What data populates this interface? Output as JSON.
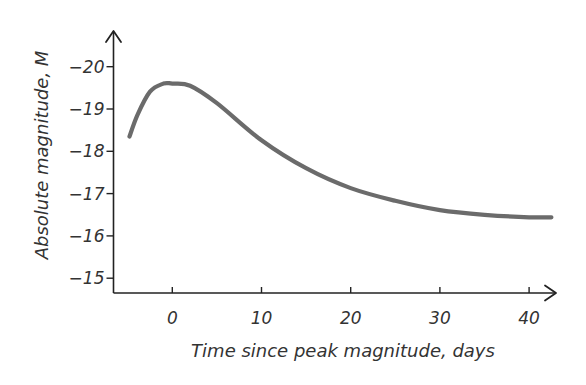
{
  "chart_data": {
    "type": "line",
    "title": "",
    "xlabel": "Time since peak magnitude, days",
    "ylabel": "Absolute magnitude, M",
    "x_ticks": [
      0,
      10,
      20,
      30,
      40
    ],
    "x_tick_labels": [
      "0",
      "10",
      "20",
      "30",
      "40"
    ],
    "y_ticks": [
      -20,
      -19,
      -18,
      -17,
      -16,
      -15
    ],
    "y_tick_labels": [
      "−20",
      "−19",
      "−18",
      "−17",
      "−16",
      "−15"
    ],
    "xlim": [
      -6.5,
      43
    ],
    "ylim": [
      -15.3,
      -20.9
    ],
    "y_inverted": true,
    "grid": false,
    "legend": null,
    "series": [
      {
        "name": "Type Ia supernova light curve",
        "color": "#6b6b6b",
        "x": [
          -4.8,
          -3.9,
          -2.5,
          -1.0,
          0,
          2,
          5,
          10,
          15,
          20,
          25,
          30,
          35,
          40,
          42.5
        ],
        "y": [
          -18.35,
          -18.86,
          -19.41,
          -19.6,
          -19.6,
          -19.55,
          -19.14,
          -18.26,
          -17.6,
          -17.13,
          -16.83,
          -16.61,
          -16.5,
          -16.44,
          -16.44
        ]
      }
    ]
  },
  "colors": {
    "axis": "#222222",
    "text": "#333333",
    "curve": "#6b6b6b",
    "background": "#ffffff"
  }
}
